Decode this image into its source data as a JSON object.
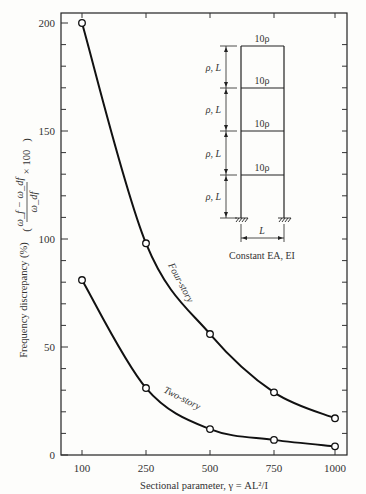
{
  "chart_data": {
    "type": "line",
    "title": "",
    "xlabel": "Sectional parameter, γ = AL²/I",
    "ylabel": "Frequency discrepancy (%) ((ω_f − ω_df)/ω_df × 100)",
    "ylabel_main": "Frequency discrepancy (%)",
    "ylabel_formula_num": "ω_f − ω_df",
    "ylabel_formula_den": "ω_df",
    "ylabel_formula_mult": "× 100",
    "x_tick_labels": [
      "100",
      "250",
      "500",
      "750",
      "1000"
    ],
    "y_tick_labels": [
      "0",
      "50",
      "100",
      "150",
      "200"
    ],
    "ylim": [
      0,
      200
    ],
    "grid": false,
    "categories": [
      100,
      250,
      500,
      750,
      1000
    ],
    "series": [
      {
        "name": "Four-story",
        "values": [
          200,
          98,
          56,
          29,
          17
        ]
      },
      {
        "name": "Two-story",
        "values": [
          81,
          31,
          12,
          7,
          4
        ]
      }
    ],
    "markers": "open-circle",
    "inset_diagram": {
      "description": "Four-story frame, width L, each story height L, floor mass 10ρ, column ρ, L",
      "floor_mass_labels": [
        "10ρ",
        "10ρ",
        "10ρ",
        "10ρ"
      ],
      "story_labels": [
        "ρ, L",
        "ρ, L",
        "ρ, L",
        "ρ, L"
      ],
      "width_label": "L",
      "caption": "Constant EA, EI"
    }
  }
}
